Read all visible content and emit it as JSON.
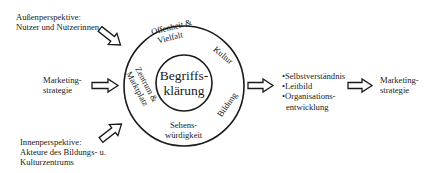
{
  "diagram": {
    "outer_perspective": {
      "line1": "Außenperspektive:",
      "line2": "Nutzer und Nutzerinnen"
    },
    "left_input": {
      "line1": "Marketing-",
      "line2": "strategie"
    },
    "inner_perspective": {
      "line1": "Innenperspektive:",
      "line2": "Akteure des Bildungs- u.",
      "line3": "Kulturzentrums"
    },
    "core": {
      "line1": "Begriffs-",
      "line2": "klärung"
    },
    "ring_segments": {
      "top_left": {
        "line1": "Offenheit &",
        "line2": "Vielfalt"
      },
      "top_right": "Kultur",
      "left": {
        "line1": "Zentrum &",
        "line2": "Marktplatz"
      },
      "right": "Bildung",
      "bottom": {
        "line1": "Sehens-",
        "line2": "würdigkeit"
      }
    },
    "outcomes": {
      "items": [
        "•Selbstverständnis",
        "•Leitbild",
        "•Organisations-",
        "entwicklung"
      ]
    },
    "right_output": {
      "line1": "Marketing-",
      "line2": "strategie"
    },
    "colors": {
      "stroke": "#1a1a1a",
      "background": "#ffffff",
      "arrow_fill": "#ffffff"
    }
  }
}
